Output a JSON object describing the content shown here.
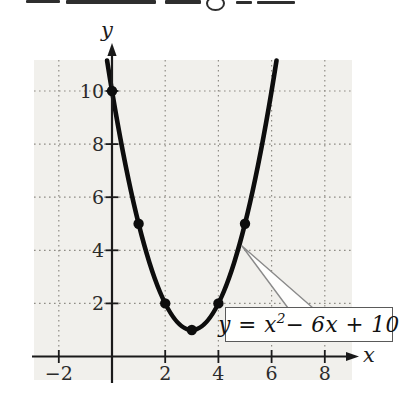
{
  "figure": {
    "x_axis_letter": "x",
    "y_axis_letter": "y",
    "equation": {
      "lhs": "y = x",
      "exp": "2",
      "rhs": " − 6x + 10"
    }
  },
  "chart_data": {
    "type": "line",
    "title": "",
    "xlabel": "x",
    "ylabel": "y",
    "equation_text": "y = x² − 6x + 10",
    "curve": {
      "a": 1,
      "b": -6,
      "c": 10,
      "x_domain": [
        -0.186,
        6.186
      ]
    },
    "points": [
      [
        0,
        10
      ],
      [
        1,
        5
      ],
      [
        2,
        2
      ],
      [
        3,
        1
      ],
      [
        4,
        2
      ],
      [
        5,
        5
      ]
    ],
    "x_ticks": [
      {
        "value": -2,
        "label": "−2"
      },
      {
        "value": 2,
        "label": "2"
      },
      {
        "value": 4,
        "label": "4"
      },
      {
        "value": 6,
        "label": "6"
      },
      {
        "value": 8,
        "label": "8"
      }
    ],
    "y_ticks": [
      {
        "value": 2,
        "label": "2"
      },
      {
        "value": 4,
        "label": "4"
      },
      {
        "value": 6,
        "label": "6"
      },
      {
        "value": 8,
        "label": "8"
      },
      {
        "value": 10,
        "label": "10"
      }
    ],
    "grid": {
      "x": [
        -2,
        2,
        4,
        6,
        8
      ],
      "y": [
        2,
        4,
        6,
        8,
        10
      ],
      "style": "dotted"
    },
    "xlim": [
      -3,
      9.3
    ],
    "ylim": [
      0,
      11.2
    ],
    "legend": "none",
    "mapping": {
      "origin_px": {
        "x": 112,
        "y": 356.5
      },
      "unit_px": {
        "x": 26.6,
        "y": 26.55
      }
    },
    "plot_rect": {
      "left": 34,
      "top": 60,
      "right": 352,
      "bottom": 380
    },
    "axes_px": {
      "x": {
        "start": 32,
        "end": 348,
        "arrow_tip": 359
      },
      "y": {
        "start": 383,
        "end": 52,
        "arrow_tip": 43
      }
    },
    "tick_half_len": 6.5,
    "point_radius": 5.2,
    "callout": {
      "apex_px": [
        242,
        246
      ],
      "base_px": [
        [
          288,
          308
        ],
        [
          313,
          308
        ]
      ]
    },
    "colors": {
      "plot_bg": "#f1f0ec",
      "grid": "#8f8c85",
      "axis": "#1a1a1a",
      "curve": "#0d0d0d",
      "point": "#0d0d0d",
      "wedge_fill": "#fefefd",
      "wedge_stroke": "#8a8a8a"
    },
    "label_px": {
      "x_tick_y": 364,
      "y_tick_right": 104
    }
  }
}
